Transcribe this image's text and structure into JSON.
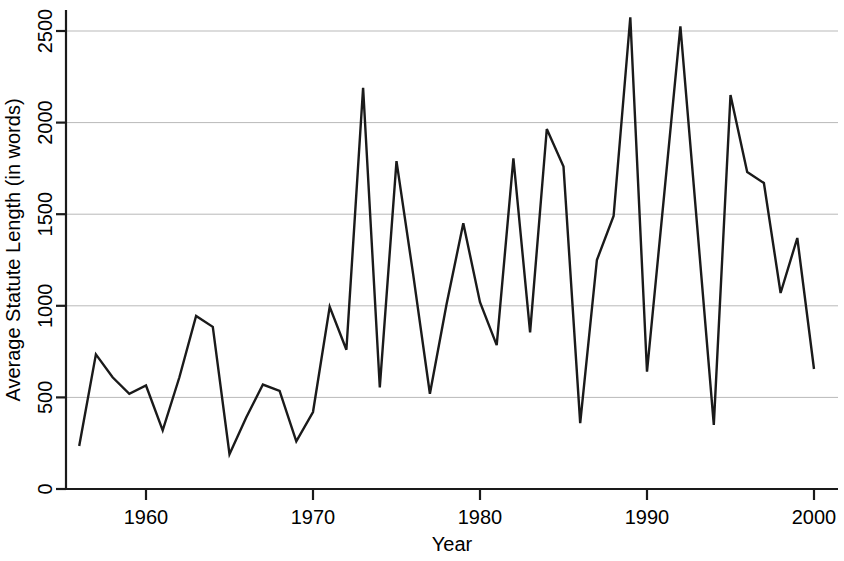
{
  "chart_data": {
    "type": "line",
    "title": "",
    "xlabel": "Year",
    "ylabel": "Average Statute Length (in words)",
    "xlim": [
      1955.4,
      2001.0
    ],
    "ylim": [
      0,
      2620
    ],
    "xticks": [
      1960,
      1970,
      1980,
      1990,
      2000
    ],
    "xtick_labels": [
      "1960",
      "1970",
      "1980",
      "1990",
      "2000"
    ],
    "yticks": [
      0,
      500,
      1000,
      1500,
      2000,
      2500
    ],
    "ytick_labels": [
      "0",
      "500",
      "1000",
      "1500",
      "2000",
      "2500"
    ],
    "grid": true,
    "grid_axis": "y",
    "legend": null,
    "line_color": "#1a1a1a",
    "line_width": 2.4,
    "x": [
      1956,
      1957,
      1958,
      1959,
      1960,
      1961,
      1962,
      1963,
      1964,
      1965,
      1966,
      1967,
      1968,
      1969,
      1970,
      1971,
      1972,
      1973,
      1974,
      1975,
      1976,
      1977,
      1978,
      1979,
      1980,
      1981,
      1982,
      1983,
      1984,
      1985,
      1986,
      1987,
      1988,
      1989,
      1990,
      1991,
      1992,
      1993,
      1994,
      1995,
      1996,
      1997,
      1998,
      1999,
      2000
    ],
    "values": [
      235,
      735,
      610,
      520,
      565,
      320,
      610,
      945,
      885,
      190,
      390,
      570,
      535,
      260,
      420,
      995,
      760,
      2190,
      555,
      1790,
      1170,
      520,
      1010,
      1450,
      1020,
      785,
      1805,
      855,
      1965,
      1760,
      360,
      1250,
      1490,
      2575,
      640,
      1580,
      2525,
      1440,
      350,
      2150,
      1730,
      1670,
      1070,
      1370,
      655
    ]
  },
  "axes": {
    "x_axis_name": "year-axis",
    "y_axis_name": "statute-length-axis"
  }
}
